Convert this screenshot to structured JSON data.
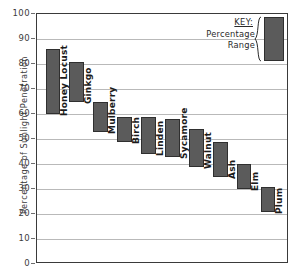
{
  "chart_data": {
    "type": "bar",
    "title": "",
    "subtitle": "",
    "xlabel": "",
    "ylabel": "Percentage of Sunlight Penetration",
    "ylim": [
      0,
      100
    ],
    "yticks": [
      0,
      10,
      20,
      30,
      40,
      50,
      60,
      70,
      80,
      90,
      100
    ],
    "ytick_labels": [
      "0",
      "10",
      "20",
      "30",
      "40",
      "50",
      "60",
      "70",
      "80",
      "90",
      "100"
    ],
    "grid": true,
    "legend_position": "top-right",
    "bar_style": "floating range bars",
    "categories": [
      "Honey Locust",
      "Ginkgo",
      "Mulberry",
      "Birch",
      "Linden",
      "Sycamore",
      "Walnut",
      "Ash",
      "Elm",
      "Plum"
    ],
    "ranges": [
      {
        "category": "Honey Locust",
        "low": 60,
        "high": 86
      },
      {
        "category": "Ginkgo",
        "low": 65,
        "high": 81
      },
      {
        "category": "Mulberry",
        "low": 53,
        "high": 65
      },
      {
        "category": "Birch",
        "low": 49,
        "high": 59
      },
      {
        "category": "Linden",
        "low": 44,
        "high": 59
      },
      {
        "category": "Sycamore",
        "low": 43,
        "high": 58
      },
      {
        "category": "Walnut",
        "low": 39,
        "high": 54
      },
      {
        "category": "Ash",
        "low": 35,
        "high": 49
      },
      {
        "category": "Elm",
        "low": 30,
        "high": 40
      },
      {
        "category": "Plum",
        "low": 21,
        "high": 31
      }
    ],
    "series": [
      {
        "name": "Range low",
        "values": [
          60,
          65,
          53,
          49,
          44,
          43,
          39,
          35,
          30,
          21
        ]
      },
      {
        "name": "Range high",
        "values": [
          86,
          81,
          65,
          59,
          59,
          58,
          54,
          49,
          40,
          31
        ]
      }
    ],
    "colors": {
      "bar_fill": "#5b5b5b",
      "bar_stroke": "#2f2f2f",
      "gridline": "#b9b9b9",
      "axis": "#3a3a3a",
      "text": "#2a2a2a"
    }
  },
  "legend": {
    "title": "KEY:",
    "description_line1": "Percentage",
    "description_line2": "Range"
  }
}
